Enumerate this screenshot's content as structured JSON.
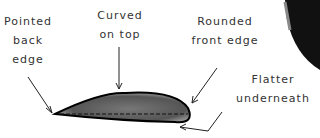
{
  "labels": {
    "back_edge": [
      "Pointed",
      "back",
      "edge"
    ],
    "top": [
      "Curved",
      "on top"
    ],
    "front_edge": [
      "Rounded",
      "front edge"
    ],
    "underneath": [
      "Flatter",
      "underneath"
    ]
  }
}
